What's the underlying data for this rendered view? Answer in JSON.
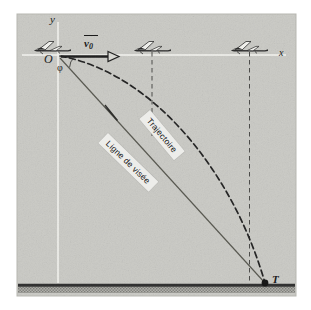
{
  "figure": {
    "kind": "physics-diagram",
    "panel": {
      "background_color": "#c9c9c4",
      "border_color": "#b4b4ae",
      "x": 17,
      "y": 14,
      "width": 279,
      "height": 282
    },
    "ground": {
      "line_color": "#2a2a2a",
      "hatch_color": "#8f8f8a",
      "y": 285
    },
    "axes": {
      "color": "#f2f2ee",
      "origin": {
        "x": 58,
        "y": 55
      },
      "x_axis_end": {
        "x": 285,
        "y": 55
      },
      "y_axis_top": {
        "x": 58,
        "y": 22
      },
      "y_axis_bottom": {
        "x": 58,
        "y": 283
      }
    },
    "labels": {
      "y_axis": "y",
      "x_axis": "x",
      "origin": "O",
      "angle": "φ",
      "target": "T",
      "velocity_symbol": "v",
      "velocity_subscript": "0"
    },
    "annotations": [
      {
        "id": "trajectoire",
        "text": "Trajectoire",
        "rotation_deg": 50
      },
      {
        "id": "ligne-de-visee",
        "text": "Ligne de visée",
        "rotation_deg": 44
      }
    ],
    "aircraft": [
      {
        "id": "aircraft-1",
        "x": 52,
        "y": 48,
        "has_drop_line": false
      },
      {
        "id": "aircraft-2",
        "x": 152,
        "y": 48,
        "has_drop_line": true,
        "drop_line": {
          "x": 152,
          "y_top": 52,
          "y_bottom": 136
        }
      },
      {
        "id": "aircraft-3",
        "x": 249,
        "y": 48,
        "has_drop_line": true,
        "drop_line": {
          "x": 249,
          "y_top": 52,
          "y_bottom": 284
        }
      }
    ],
    "velocity_vector": {
      "from": {
        "x": 62,
        "y": 56
      },
      "to": {
        "x": 118,
        "y": 56
      },
      "arrowhead": "hollow-triangle",
      "color": "#1b1b1b"
    },
    "trajectory": {
      "style": "dashed",
      "color": "#242424",
      "start": {
        "x": 60,
        "y": 56
      },
      "control1": {
        "x": 150,
        "y": 72
      },
      "control2": {
        "x": 232,
        "y": 168
      },
      "end": {
        "x": 265,
        "y": 283
      }
    },
    "line_of_sight": {
      "style": "solid",
      "color": "#555552",
      "start": {
        "x": 60,
        "y": 58
      },
      "end": {
        "x": 265,
        "y": 283
      },
      "arrow_at": {
        "x": 113,
        "y": 116
      }
    },
    "angle_arc": {
      "center": {
        "x": 60,
        "y": 57
      },
      "radius": 14,
      "from_deg": 0,
      "to_deg": 48
    },
    "target_point": {
      "x": 265,
      "y": 283,
      "radius": 3.2,
      "color": "#141414"
    }
  }
}
